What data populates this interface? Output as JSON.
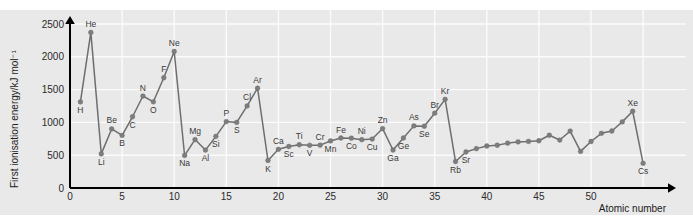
{
  "chart_data": {
    "type": "line",
    "title": "",
    "subtitle": "",
    "xlabel": "Atomic number",
    "ylabel": "First ionisation energy/kJ mol⁻¹",
    "xlim": [
      0,
      58
    ],
    "ylim": [
      0,
      2700
    ],
    "xticks": [
      0,
      5,
      10,
      15,
      20,
      25,
      30,
      35,
      40,
      45,
      50
    ],
    "yticks": [
      0,
      500,
      1000,
      1500,
      2000,
      2500
    ],
    "grid": true,
    "legend": null,
    "marker": "circle",
    "series": [
      {
        "name": "First ionisation energy",
        "color": "#7d7d7d",
        "points": [
          {
            "x": 1,
            "y": 1312,
            "label": "H",
            "pos": "below"
          },
          {
            "x": 2,
            "y": 2372,
            "label": "He",
            "pos": "above"
          },
          {
            "x": 3,
            "y": 520,
            "label": "Li",
            "pos": "below"
          },
          {
            "x": 4,
            "y": 900,
            "label": "Be",
            "pos": "above"
          },
          {
            "x": 5,
            "y": 801,
            "label": "B",
            "pos": "below"
          },
          {
            "x": 6,
            "y": 1086,
            "label": "C",
            "pos": "below"
          },
          {
            "x": 7,
            "y": 1402,
            "label": "N",
            "pos": "above"
          },
          {
            "x": 8,
            "y": 1314,
            "label": "O",
            "pos": "below"
          },
          {
            "x": 9,
            "y": 1681,
            "label": "F",
            "pos": "above"
          },
          {
            "x": 10,
            "y": 2081,
            "label": "Ne",
            "pos": "above"
          },
          {
            "x": 11,
            "y": 496,
            "label": "Na",
            "pos": "below"
          },
          {
            "x": 12,
            "y": 738,
            "label": "Mg",
            "pos": "above"
          },
          {
            "x": 13,
            "y": 578,
            "label": "Al",
            "pos": "below"
          },
          {
            "x": 14,
            "y": 787,
            "label": "Si",
            "pos": "below"
          },
          {
            "x": 15,
            "y": 1012,
            "label": "P",
            "pos": "above"
          },
          {
            "x": 16,
            "y": 1000,
            "label": "S",
            "pos": "below"
          },
          {
            "x": 17,
            "y": 1251,
            "label": "Cl",
            "pos": "above"
          },
          {
            "x": 18,
            "y": 1521,
            "label": "Ar",
            "pos": "above"
          },
          {
            "x": 19,
            "y": 419,
            "label": "K",
            "pos": "below"
          },
          {
            "x": 20,
            "y": 590,
            "label": "Ca",
            "pos": "above"
          },
          {
            "x": 21,
            "y": 633,
            "label": "Sc",
            "pos": "below"
          },
          {
            "x": 22,
            "y": 659,
            "label": "Ti",
            "pos": "above"
          },
          {
            "x": 23,
            "y": 651,
            "label": "V",
            "pos": "below"
          },
          {
            "x": 24,
            "y": 653,
            "label": "Cr",
            "pos": "above"
          },
          {
            "x": 25,
            "y": 717,
            "label": "Mn",
            "pos": "below"
          },
          {
            "x": 26,
            "y": 762,
            "label": "Fe",
            "pos": "above"
          },
          {
            "x": 27,
            "y": 760,
            "label": "Co",
            "pos": "below"
          },
          {
            "x": 28,
            "y": 737,
            "label": "Ni",
            "pos": "above"
          },
          {
            "x": 29,
            "y": 746,
            "label": "Cu",
            "pos": "below"
          },
          {
            "x": 30,
            "y": 906,
            "label": "Zn",
            "pos": "above"
          },
          {
            "x": 31,
            "y": 579,
            "label": "Ga",
            "pos": "below"
          },
          {
            "x": 32,
            "y": 762,
            "label": "Ge",
            "pos": "below"
          },
          {
            "x": 33,
            "y": 947,
            "label": "As",
            "pos": "above"
          },
          {
            "x": 34,
            "y": 941,
            "label": "Se",
            "pos": "below"
          },
          {
            "x": 35,
            "y": 1140,
            "label": "Br",
            "pos": "above"
          },
          {
            "x": 36,
            "y": 1351,
            "label": "Kr",
            "pos": "above"
          },
          {
            "x": 37,
            "y": 403,
            "label": "Rb",
            "pos": "below"
          },
          {
            "x": 38,
            "y": 549,
            "label": "Sr",
            "pos": "below"
          },
          {
            "x": 39,
            "y": 600,
            "label": "",
            "pos": "above"
          },
          {
            "x": 40,
            "y": 640,
            "label": "",
            "pos": "above"
          },
          {
            "x": 41,
            "y": 652,
            "label": "",
            "pos": "above"
          },
          {
            "x": 42,
            "y": 684,
            "label": "",
            "pos": "above"
          },
          {
            "x": 43,
            "y": 702,
            "label": "",
            "pos": "above"
          },
          {
            "x": 44,
            "y": 710,
            "label": "",
            "pos": "above"
          },
          {
            "x": 45,
            "y": 720,
            "label": "",
            "pos": "above"
          },
          {
            "x": 46,
            "y": 804,
            "label": "",
            "pos": "above"
          },
          {
            "x": 47,
            "y": 731,
            "label": "",
            "pos": "above"
          },
          {
            "x": 48,
            "y": 868,
            "label": "",
            "pos": "above"
          },
          {
            "x": 49,
            "y": 558,
            "label": "",
            "pos": "above"
          },
          {
            "x": 50,
            "y": 709,
            "label": "",
            "pos": "above"
          },
          {
            "x": 51,
            "y": 834,
            "label": "",
            "pos": "above"
          },
          {
            "x": 52,
            "y": 869,
            "label": "",
            "pos": "above"
          },
          {
            "x": 53,
            "y": 1008,
            "label": "",
            "pos": "above"
          },
          {
            "x": 54,
            "y": 1170,
            "label": "Xe",
            "pos": "above"
          },
          {
            "x": 55,
            "y": 376,
            "label": "Cs",
            "pos": "below"
          }
        ]
      }
    ]
  }
}
